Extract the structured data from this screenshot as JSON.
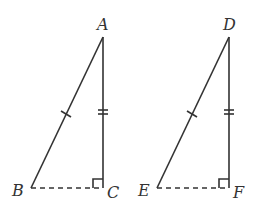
{
  "diagram": {
    "stroke_color": "#333333",
    "triangles": [
      {
        "name": "ABC",
        "vertices": {
          "A": {
            "label": "A",
            "x": 103,
            "y": 37
          },
          "B": {
            "label": "B",
            "x": 31,
            "y": 188
          },
          "C": {
            "label": "C",
            "x": 103,
            "y": 188
          }
        },
        "hypotenuse_marks": 1,
        "leg_marks": 2,
        "right_angle_at": "C",
        "dashed_side": "BC"
      },
      {
        "name": "DEF",
        "vertices": {
          "D": {
            "label": "D",
            "x": 229,
            "y": 37
          },
          "E": {
            "label": "E",
            "x": 157,
            "y": 188
          },
          "F": {
            "label": "F",
            "x": 229,
            "y": 188
          }
        },
        "hypotenuse_marks": 1,
        "leg_marks": 2,
        "right_angle_at": "F",
        "dashed_side": "EF"
      }
    ]
  }
}
